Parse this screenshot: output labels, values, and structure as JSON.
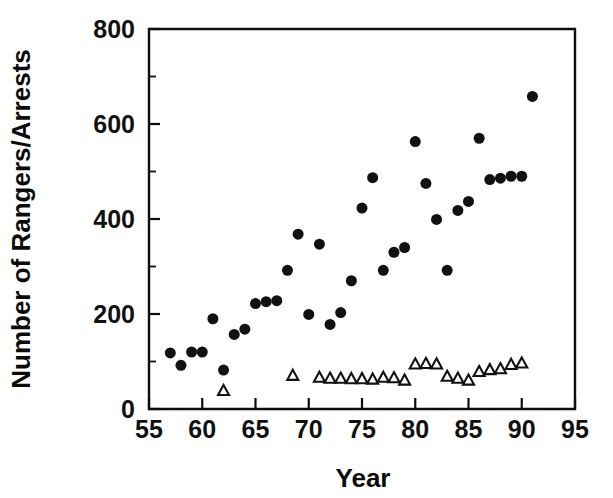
{
  "figure": {
    "background_color": "#ffffff",
    "foreground_color": "#111111",
    "width": 613,
    "height": 498
  },
  "axes": {
    "x_title": "Year",
    "y_title": "Number of Rangers/Arrests",
    "x_ticks": [
      "55",
      "60",
      "65",
      "70",
      "75",
      "80",
      "85",
      "90",
      "95"
    ],
    "y_ticks": [
      "0",
      "200",
      "400",
      "600",
      "800"
    ]
  },
  "chart_data": {
    "type": "scatter",
    "title": "",
    "xlabel": "Year",
    "ylabel": "Number of Rangers/Arrests",
    "xlim": [
      55,
      95
    ],
    "ylim": [
      0,
      800
    ],
    "x_tick_values": [
      55,
      60,
      65,
      70,
      75,
      80,
      85,
      90,
      95
    ],
    "y_tick_values": [
      0,
      200,
      400,
      600,
      800
    ],
    "x_minor_tick_step": 1,
    "y_minor_tick_step": 100,
    "grid": false,
    "legend": "none",
    "series": [
      {
        "name": "Arrests",
        "marker": "filled-circle",
        "marker_color": "#111111",
        "marker_size": 11,
        "points": [
          [
            57,
            118
          ],
          [
            58,
            92
          ],
          [
            59,
            120
          ],
          [
            60,
            120
          ],
          [
            61,
            190
          ],
          [
            62,
            82
          ],
          [
            63,
            157
          ],
          [
            64,
            168
          ],
          [
            65,
            222
          ],
          [
            66,
            226
          ],
          [
            67,
            228
          ],
          [
            68,
            292
          ],
          [
            69,
            368
          ],
          [
            70,
            199
          ],
          [
            71,
            347
          ],
          [
            72,
            178
          ],
          [
            73,
            203
          ],
          [
            74,
            270
          ],
          [
            75,
            423
          ],
          [
            76,
            487
          ],
          [
            77,
            292
          ],
          [
            78,
            330
          ],
          [
            79,
            340
          ],
          [
            80,
            563
          ],
          [
            81,
            475
          ],
          [
            82,
            399
          ],
          [
            83,
            292
          ],
          [
            84,
            418
          ],
          [
            85,
            437
          ],
          [
            86,
            570
          ],
          [
            87,
            483
          ],
          [
            88,
            486
          ],
          [
            89,
            490
          ],
          [
            90,
            490
          ],
          [
            91,
            658
          ]
        ]
      },
      {
        "name": "Rangers",
        "marker": "open-triangle",
        "marker_color": "#111111",
        "marker_fill": "#ffffff",
        "marker_size": 11,
        "points": [
          [
            62,
            40
          ],
          [
            68.5,
            72
          ],
          [
            71,
            68
          ],
          [
            72,
            66
          ],
          [
            73,
            66
          ],
          [
            74,
            65
          ],
          [
            75,
            65
          ],
          [
            76,
            64
          ],
          [
            77,
            68
          ],
          [
            78,
            67
          ],
          [
            79,
            62
          ],
          [
            80,
            96
          ],
          [
            81,
            97
          ],
          [
            82,
            96
          ],
          [
            83,
            70
          ],
          [
            84,
            66
          ],
          [
            85,
            62
          ],
          [
            86,
            80
          ],
          [
            87,
            84
          ],
          [
            88,
            86
          ],
          [
            89,
            95
          ],
          [
            90,
            98
          ]
        ]
      }
    ]
  }
}
